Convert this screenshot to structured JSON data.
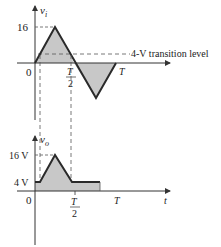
{
  "top_plot": {
    "y_label": "v",
    "y_label_sub": "i",
    "tick_16": "16",
    "origin": "0",
    "t_half_num": "T",
    "t_half_den": "2",
    "t_full": "T",
    "transition_label": "4-V transition level"
  },
  "bottom_plot": {
    "y_label": "v",
    "y_label_sub": "o",
    "tick_16": "16 V",
    "tick_4": "4 V",
    "origin": "0",
    "t_half_num": "T",
    "t_half_den": "2",
    "t_full": "T",
    "x_label": "t"
  },
  "colors": {
    "line": "#2a2a2a",
    "fill": "#c8c8c8",
    "axis": "#333333"
  }
}
